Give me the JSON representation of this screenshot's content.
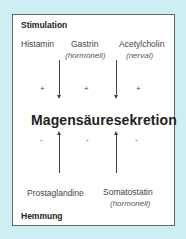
{
  "colors": {
    "background": "#cdeef3",
    "box": "#ffffff",
    "border": "#666666",
    "text": "#333333"
  },
  "stimulation": {
    "heading": "Stimulation",
    "items": [
      {
        "label": "Histamin",
        "sub": ""
      },
      {
        "label": "Gastrin",
        "sub": "(hormonell)"
      },
      {
        "label": "Acetylcholin",
        "sub": "(nerval)"
      }
    ],
    "signs": [
      "+",
      "+",
      "+"
    ]
  },
  "center": {
    "label": "Magensäuresekretion"
  },
  "inhibition": {
    "heading": "Hemmung",
    "items": [
      {
        "label": "Prostaglandine",
        "sub": ""
      },
      {
        "label": "Somatostatin",
        "sub": "(hormonell)"
      }
    ],
    "signs": [
      "-",
      "-",
      "-"
    ]
  },
  "arrows": [
    {
      "from": "Gastrin",
      "direction": "down",
      "to": "Magensäuresekretion"
    },
    {
      "from": "Acetylcholin",
      "direction": "down",
      "to": "Magensäuresekretion"
    },
    {
      "from": "Prostaglandine",
      "direction": "up",
      "to": "Magensäuresekretion"
    },
    {
      "from": "Somatostatin",
      "direction": "up",
      "to": "Magensäuresekretion"
    }
  ]
}
